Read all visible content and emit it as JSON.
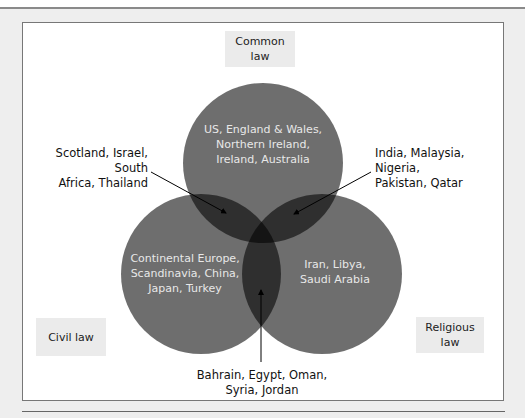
{
  "diagram": {
    "type": "venn",
    "sets": [
      {
        "id": "common",
        "label": "Common\nlaw",
        "members": "US, England & Wales,\nNorthern Ireland,\nIreland, Australia"
      },
      {
        "id": "civil",
        "label": "Civil law",
        "members": "Continental Europe,\nScandinavia, China,\nJapan, Turkey"
      },
      {
        "id": "religious",
        "label": "Religious\nlaw",
        "members": "Iran, Libya,\nSaudi Arabia"
      }
    ],
    "overlaps": {
      "common_civil": "Scotland, Israel, South\nAfrica, Thailand",
      "common_religious": "India, Malaysia, Nigeria,\nPakistan, Qatar",
      "civil_religious": "Bahrain, Egypt, Oman,\nSyria, Jordan"
    },
    "colors": {
      "circle_fill": "#000000",
      "circle_opacity": 0.57,
      "label_box_bg": "#ebebeb",
      "inner_text": "#e8e8e8"
    }
  }
}
